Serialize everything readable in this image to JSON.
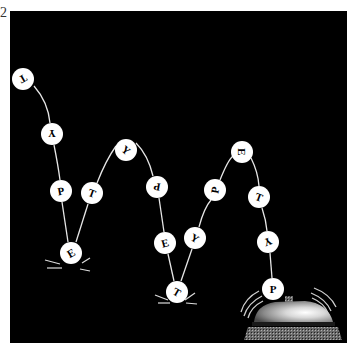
{
  "figure": {
    "label": "2",
    "background": "#000000",
    "ball_color": "#ffffff",
    "string_color": "#e6e6e6"
  },
  "balls": [
    {
      "letter": "T",
      "cx": 23,
      "cy": 79,
      "rot": 150
    },
    {
      "letter": "Y",
      "cx": 52,
      "cy": 134,
      "rot": 180
    },
    {
      "letter": "P",
      "cx": 61,
      "cy": 191,
      "rot": -10
    },
    {
      "letter": "E",
      "cx": 71,
      "cy": 253,
      "rot": -30
    },
    {
      "letter": "T",
      "cx": 92,
      "cy": 193,
      "rot": 20
    },
    {
      "letter": "Y",
      "cx": 126,
      "cy": 150,
      "rot": 40
    },
    {
      "letter": "P",
      "cx": 157,
      "cy": 187,
      "rot": 190
    },
    {
      "letter": "E",
      "cx": 165,
      "cy": 243,
      "rot": -15
    },
    {
      "letter": "T",
      "cx": 177,
      "cy": 292,
      "rot": 30
    },
    {
      "letter": "Y",
      "cx": 195,
      "cy": 238,
      "rot": 30
    },
    {
      "letter": "P",
      "cx": 215,
      "cy": 190,
      "rot": -80
    },
    {
      "letter": "E",
      "cx": 242,
      "cy": 152,
      "rot": 90
    },
    {
      "letter": "T",
      "cx": 259,
      "cy": 197,
      "rot": 20
    },
    {
      "letter": "Y",
      "cx": 268,
      "cy": 242,
      "rot": 160
    },
    {
      "letter": "P",
      "cx": 273,
      "cy": 289,
      "rot": 0
    }
  ],
  "bell": {
    "label": "desk-bell",
    "dome_color": "#9a9a9a",
    "highlight_color": "#f0f0f0",
    "base_color": "#6a6a6a"
  }
}
